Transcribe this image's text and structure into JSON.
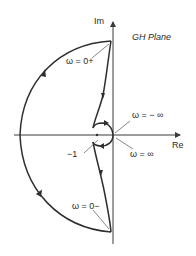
{
  "title": "GH Plane",
  "axes": {
    "imaginary_label": "Im",
    "real_label": "Re"
  },
  "annotations": {
    "omega_zero_plus": "ω = 0+",
    "omega_zero_minus": "ω = 0−",
    "omega_neg_inf": "ω = − ∞",
    "omega_pos_inf": "ω = ∞",
    "critical_point": "−1"
  },
  "colors": {
    "stroke": "#2f2f2f",
    "axis": "#3a3a3a",
    "background": "#ffffff"
  }
}
